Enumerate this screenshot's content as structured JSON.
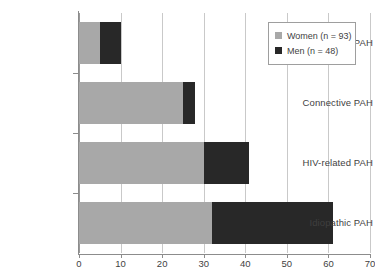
{
  "chart_data": {
    "type": "bar",
    "orientation": "horizontal",
    "stacked": true,
    "title": "",
    "xlabel": "",
    "ylabel": "",
    "categories": [
      "Congenital PAH",
      "Connective PAH",
      "HIV-related PAH",
      "Idiopathic PAH"
    ],
    "series": [
      {
        "name": "Women (n = 93)",
        "color": "#a8a8a8",
        "values": [
          5,
          25,
          30,
          32
        ]
      },
      {
        "name": "Men (n = 48)",
        "color": "#282828",
        "values": [
          5,
          3,
          11,
          29
        ]
      }
    ],
    "totals": [
      10,
      28,
      41,
      61
    ],
    "xlim": [
      0,
      70
    ],
    "xticks": [
      0,
      10,
      20,
      30,
      40,
      50,
      60,
      70
    ],
    "xtick_labels": [
      "0",
      "10",
      "20",
      "30",
      "40",
      "50",
      "60",
      "70"
    ],
    "grid": "vertical",
    "legend_position": "top-right"
  },
  "legend": {
    "items": [
      {
        "label": "Women (n = 93)",
        "swatch": "women"
      },
      {
        "label": "Men (n = 48)",
        "swatch": "men"
      }
    ]
  },
  "axis": {
    "x_labels": [
      "0",
      "10",
      "20",
      "30",
      "40",
      "50",
      "60",
      "70"
    ],
    "y_labels": [
      "Congenital PAH",
      "Connective PAH",
      "HIV-related PAH",
      "Idiopathic PAH"
    ]
  },
  "colors": {
    "women": "#a8a8a8",
    "men": "#282828",
    "grid": "#c9c9c9",
    "axis": "#8c8c8c",
    "text": "#3f3f3f",
    "background": "#ffffff"
  }
}
